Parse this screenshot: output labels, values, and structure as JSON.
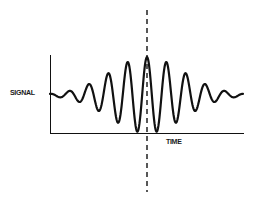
{
  "diagram": {
    "title": "",
    "labels": {
      "y_axis": "SIGNAL",
      "x_axis": "TIME"
    },
    "elements": [
      {
        "type": "axes",
        "description": "L-shaped axes: vertical signal axis and horizontal time axis"
      },
      {
        "type": "waveform",
        "description": "Oscillating signal with Gaussian-like envelope, maximum amplitude at center (interferogram / wave packet)"
      },
      {
        "type": "dashed-line",
        "description": "Vertical dashed line through the central peak of the waveform"
      }
    ],
    "colors": {
      "line": "#111111",
      "background": "#ffffff"
    }
  },
  "chart_data": {
    "type": "line",
    "title": "",
    "xlabel": "TIME",
    "ylabel": "SIGNAL",
    "grid": false,
    "legend": [],
    "annotations": [
      "vertical dashed line at central peak"
    ],
    "series": [
      {
        "name": "signal",
        "description": "cosine oscillation with Gaussian envelope centered at mid-time",
        "peaks_x_px": [
          70,
          89,
          108,
          127,
          147,
          167,
          186,
          205,
          224
        ],
        "peaks_y_px": [
          82,
          71,
          62,
          58,
          57,
          58,
          62,
          71,
          82
        ]
      }
    ]
  }
}
